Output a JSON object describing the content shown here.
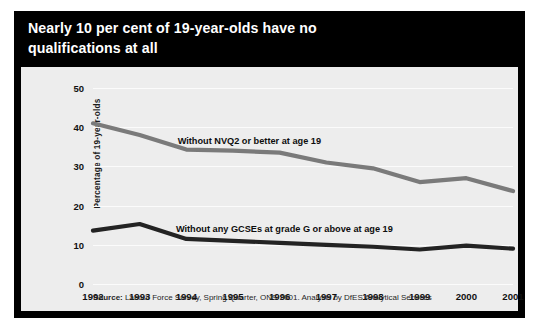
{
  "title": "Nearly 10 per cent of 19-year-olds have no\nqualifications at all",
  "source": {
    "label": "Source:",
    "text": " Labour Force Survey, Spring Quarter, ONS 2001. Analysis by DfES Analytical Services"
  },
  "colors": {
    "banner_background": "#000000",
    "banner_text": "#ffffff",
    "plot_background": "#ededed",
    "gridline": "#fbfbfb",
    "series_nvq2": "#7a7a7a",
    "series_gcse": "#232323",
    "frame": "#000000"
  },
  "chart_data": {
    "type": "line",
    "title": "Nearly 10 per cent of 19-year-olds have no qualifications at all",
    "xlabel": "",
    "ylabel": "Percentage of 19-year-olds",
    "categories": [
      "1992",
      "1993",
      "1994",
      "1995",
      "1996",
      "1997",
      "1998",
      "1999",
      "2000",
      "2001"
    ],
    "x": [
      1992,
      1993,
      1994,
      1995,
      1996,
      1997,
      1998,
      1999,
      2000,
      2001
    ],
    "ylim": [
      0,
      50
    ],
    "yticks": [
      0,
      10,
      20,
      30,
      40,
      50
    ],
    "grid": true,
    "legend_position": "inline-annotation",
    "series": [
      {
        "name": "Without NVQ2 or better at age 19",
        "color": "#7a7a7a",
        "values": [
          41.0,
          38.0,
          34.3,
          34.0,
          33.5,
          31.0,
          29.5,
          26.0,
          27.0,
          23.7
        ],
        "annotation": "Without NVQ2 or better at age 19"
      },
      {
        "name": "Without any GCSEs at grade G or above at age 19",
        "color": "#232323",
        "values": [
          13.6,
          15.3,
          11.5,
          11.0,
          10.5,
          10.0,
          9.5,
          8.8,
          9.8,
          9.0
        ],
        "annotation": "Without any GCSEs at grade G or above at age 19"
      }
    ]
  },
  "annotations": {
    "nvq2": {
      "label": "Without NVQ2 or better at age 19",
      "x_year": 1995.35,
      "y_value": 36.6
    },
    "gcse": {
      "label": "Without any GCSEs at grade G or above at age 19",
      "x_year": 1996.1,
      "y_value": 14.0
    }
  }
}
